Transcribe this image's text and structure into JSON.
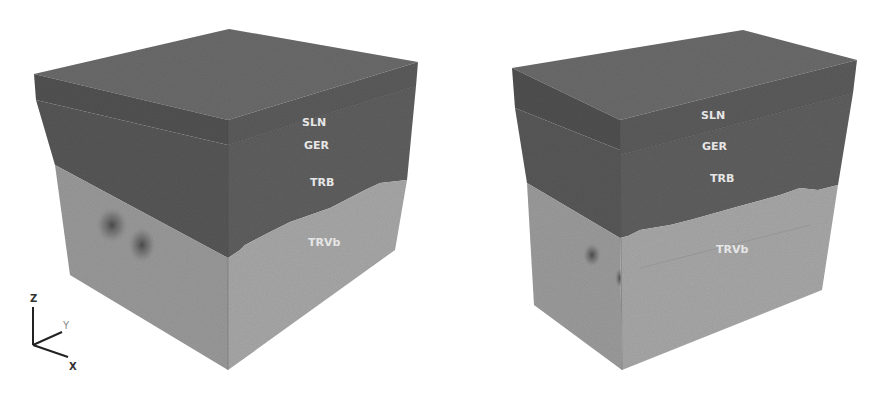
{
  "figure": {
    "colors": {
      "background": "#ffffff",
      "top_face": "#6a6a6a",
      "sln_layer_front": "#5a5a5a",
      "sln_layer_side": "#505050",
      "ger_trb_front": "#5e5e5e",
      "ger_trb_side": "#545454",
      "trvb_front": "#a3a3a3",
      "trvb_side": "#969696",
      "label_text": "#e6e6e6"
    }
  },
  "axes": {
    "z": "Z",
    "y": "Y",
    "x": "X"
  },
  "left_block": {
    "labels": {
      "sln": "SLN",
      "ger": "GER",
      "trb": "TRB",
      "trvb": "TRVb"
    }
  },
  "right_block": {
    "labels": {
      "sln": "SLN",
      "ger": "GER",
      "trb": "TRB",
      "trvb": "TRVb"
    }
  }
}
